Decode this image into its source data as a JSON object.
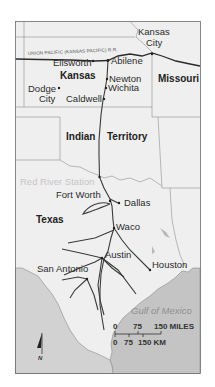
{
  "map": {
    "title": "Chisholm Trail cattle drive route",
    "colors": {
      "land": "#efefef",
      "water": "#c4c4c4",
      "border": "#8a8a8a",
      "trail": "#3c3c3c",
      "frame": "#6e6e6e"
    },
    "railroad_label": "UNION PACIFIC (KANSAS PACIFIC) R.R.",
    "regions": [
      {
        "name": "Kansas"
      },
      {
        "name": "Missouri"
      },
      {
        "name": "Indian"
      },
      {
        "name": "Territory"
      },
      {
        "name": "Texas"
      }
    ],
    "cities": [
      {
        "name": "Kansas"
      },
      {
        "name": "City"
      },
      {
        "name": "Ellsworth"
      },
      {
        "name": "Abilene"
      },
      {
        "name": "Newton"
      },
      {
        "name": "Wichita"
      },
      {
        "name": "Dodge"
      },
      {
        "name": "City"
      },
      {
        "name": "Caldwell"
      },
      {
        "name": "Fort Worth"
      },
      {
        "name": "Dallas"
      },
      {
        "name": "Waco"
      },
      {
        "name": "Austin"
      },
      {
        "name": "San Antonio"
      },
      {
        "name": "Houston"
      }
    ],
    "features": {
      "river_crossing": "Red River Station",
      "water_body": "Gulf of Mexico"
    },
    "scale_bar": {
      "miles_ticks": [
        "0",
        "75",
        "150 MILES"
      ],
      "km_ticks": [
        "0",
        "75",
        "150 KM"
      ]
    },
    "north_arrow": {
      "label": "N"
    }
  }
}
